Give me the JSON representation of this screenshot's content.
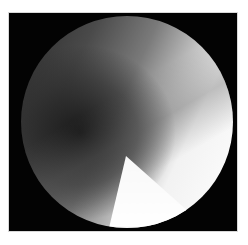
{
  "image": {
    "description": "Grayscale circular field-of-view image on black square background",
    "colors": {
      "background": "#ffffff",
      "frame": "#030303",
      "bright_region": "#ffffff",
      "dark_region": "#1a1a1a"
    }
  }
}
